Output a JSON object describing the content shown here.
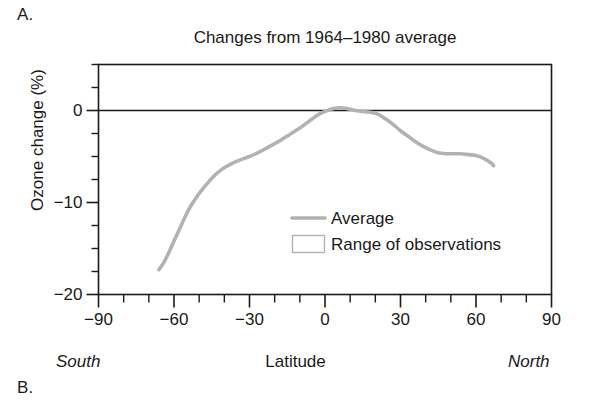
{
  "figure": {
    "panel_a_label": "A.",
    "panel_b_label": "B."
  },
  "chart_data": {
    "type": "line",
    "title": "Changes from 1964–1980 average",
    "xlabel": "Latitude",
    "ylabel": "Ozone change (%)",
    "xlim": [
      -90,
      90
    ],
    "ylim": [
      -20,
      5
    ],
    "grid": false,
    "x_major_ticks": [
      -90,
      -60,
      -30,
      0,
      30,
      60,
      90
    ],
    "x_major_tick_labels": [
      "−90",
      "−60",
      "−30",
      "0",
      "30",
      "60",
      "90"
    ],
    "x_minor_tick_step": 10,
    "y_major_ticks": [
      0,
      -10,
      -20
    ],
    "y_major_tick_labels": [
      "0",
      "−10",
      "−20"
    ],
    "y_minor_tick_step": 2.5,
    "axis_end_labels": {
      "left": "South",
      "right": "North"
    },
    "zero_reference_line": 0,
    "legend_position": "center-right-inside",
    "legend": [
      {
        "label": "Average",
        "marker": "line",
        "color": "#b2b2b2"
      },
      {
        "label": "Range of observations",
        "marker": "box",
        "color": "#ffffff",
        "edge": "#b2b2b2"
      }
    ],
    "series": [
      {
        "name": "Average",
        "color": "#b2b2b2",
        "x": [
          -66,
          -64,
          -62,
          -60,
          -58,
          -56,
          -54,
          -52,
          -50,
          -47,
          -44,
          -41,
          -38,
          -34,
          -30,
          -26,
          -22,
          -18,
          -14,
          -10,
          -6,
          -3,
          0,
          3,
          6,
          9,
          12,
          15,
          18,
          21,
          24,
          27,
          30,
          33,
          36,
          39,
          42,
          45,
          48,
          51,
          54,
          57,
          60,
          63,
          66,
          67
        ],
        "y": [
          -17.3,
          -16.5,
          -15.4,
          -14.2,
          -13.0,
          -11.8,
          -10.7,
          -9.8,
          -9.0,
          -8.0,
          -7.1,
          -6.4,
          -5.9,
          -5.4,
          -5.0,
          -4.5,
          -3.9,
          -3.3,
          -2.6,
          -1.9,
          -1.1,
          -0.5,
          -0.1,
          0.2,
          0.3,
          0.2,
          0.0,
          -0.1,
          -0.2,
          -0.4,
          -0.9,
          -1.5,
          -2.2,
          -2.8,
          -3.4,
          -3.9,
          -4.3,
          -4.6,
          -4.7,
          -4.7,
          -4.7,
          -4.8,
          -4.9,
          -5.2,
          -5.7,
          -6.0
        ]
      }
    ]
  }
}
